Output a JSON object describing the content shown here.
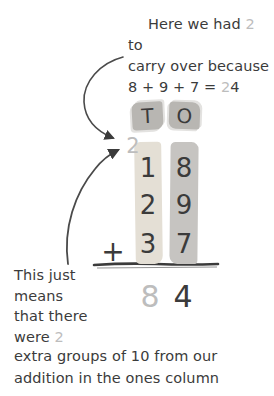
{
  "colors": {
    "ink": "#3b3b3b",
    "gray_accent": "#bdbdbd",
    "tens_highlight": "#e4dfd5",
    "ones_highlight": "#c6c4c1",
    "header_highlight": "#b8b6b2",
    "bg": "#ffffff"
  },
  "notes": {
    "top": {
      "l1a": "Here we had ",
      "l1num": "2",
      "l1b": " to",
      "l2": "carry over because",
      "l3a": "8 + 9 + 7 = ",
      "l3num": "2",
      "l3b": "4"
    },
    "left": {
      "l1": "This just",
      "l2": "means",
      "l3": "that there",
      "l4a": "were ",
      "l4num": "2",
      "l5": "extra groups of 10 from our",
      "l6": "addition in the ones column"
    }
  },
  "headers": {
    "tens": "T",
    "ones": "O"
  },
  "carry": "2",
  "problem": {
    "operator": "+",
    "rows": [
      {
        "tens": "1",
        "ones": "8"
      },
      {
        "tens": "2",
        "ones": "9"
      },
      {
        "tens": "3",
        "ones": "7"
      }
    ],
    "result": {
      "tens": "8",
      "ones": "4"
    }
  }
}
